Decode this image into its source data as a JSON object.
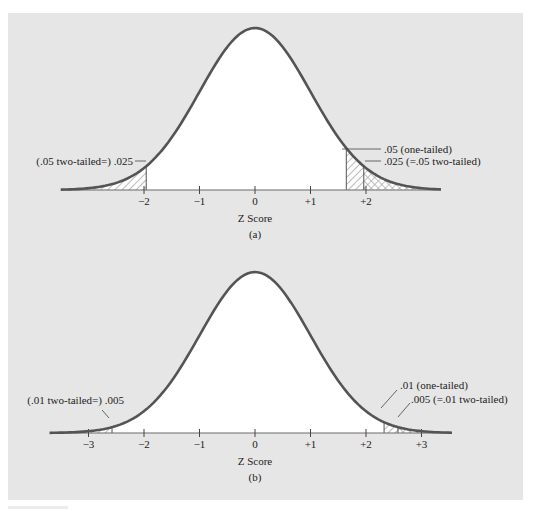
{
  "colors": {
    "panel_bg": "#e6e6e6",
    "curve": "#545454",
    "axis": "#6a6a6a",
    "hatch": "#9a9a9a",
    "under_curve": "#ffffff",
    "text": "#222222"
  },
  "chart_data": [
    {
      "type": "area",
      "panel": "a",
      "title": "(a)",
      "xlabel": "Z Score",
      "ylabel": "",
      "distribution": "standard normal",
      "xlim": [
        -3.5,
        3.35
      ],
      "ticks": [
        -2,
        -1,
        0,
        1,
        2
      ],
      "tick_labels": [
        "−2",
        "−1",
        "0",
        "+1",
        "+2"
      ],
      "shaded_regions": [
        {
          "from": -3.5,
          "to": -1.96,
          "pattern": "diagonal",
          "area": 0.025
        },
        {
          "from": 1.645,
          "to": 1.96,
          "pattern": "diagonal",
          "area": 0.025
        },
        {
          "from": 1.96,
          "to": 3.35,
          "pattern": "crosshatch",
          "area": 0.025
        }
      ],
      "cutoffs": [
        -1.96,
        1.645,
        1.96
      ],
      "annotations": [
        {
          "text": "(.05 two-tailed=) .025",
          "points_to": -1.96
        },
        {
          "text": ".05 (one-tailed)",
          "points_to": 1.645
        },
        {
          "text": ".025 (=.05 two-tailed)",
          "points_to": 1.96
        }
      ]
    },
    {
      "type": "area",
      "panel": "b",
      "title": "(b)",
      "xlabel": "Z Score",
      "ylabel": "",
      "distribution": "standard normal",
      "xlim": [
        -3.7,
        3.55
      ],
      "ticks": [
        -3,
        -2,
        -1,
        0,
        1,
        2,
        3
      ],
      "tick_labels": [
        "−3",
        "−2",
        "−1",
        "0",
        "+1",
        "+2",
        "+3"
      ],
      "shaded_regions": [
        {
          "from": -3.7,
          "to": -2.576,
          "pattern": "diagonal",
          "area": 0.005
        },
        {
          "from": 2.326,
          "to": 2.576,
          "pattern": "diagonal",
          "area": 0.005
        },
        {
          "from": 2.576,
          "to": 3.55,
          "pattern": "crosshatch",
          "area": 0.005
        }
      ],
      "cutoffs": [
        -2.576,
        2.326,
        2.576
      ],
      "annotations": [
        {
          "text": "(.01 two-tailed=) .005",
          "points_to": -2.576
        },
        {
          "text": ".01 (one-tailed)",
          "points_to": 2.326
        },
        {
          "text": ".005 (=.01 two-tailed)",
          "points_to": 2.576
        }
      ]
    }
  ],
  "layout": {
    "panels": [
      {
        "cx": 255,
        "sigma_px": 55.5,
        "baseline_y": 190,
        "peak_h": 162,
        "label_y": 205,
        "xlabel_y": 222,
        "caption_y": 238
      },
      {
        "cx": 255,
        "sigma_px": 55.5,
        "baseline_y": 433,
        "peak_h": 161,
        "label_y": 448,
        "xlabel_y": 465,
        "caption_y": 481
      }
    ]
  }
}
